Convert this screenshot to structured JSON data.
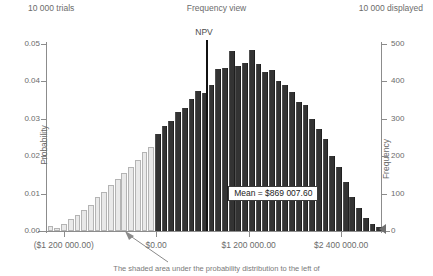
{
  "header": {
    "trials": "10 000 trials",
    "title": "Frequency view",
    "displayed": "10 000 displayed"
  },
  "annotations": {
    "npv_label": "NPV",
    "mean_label": "Mean = $869 007.60",
    "caption": "The shaded area under the probability distribution to the left of"
  },
  "colors": {
    "bar_dark": "#333333",
    "bar_light": "#e9e9e9",
    "bar_light_border": "#b4b4b4",
    "axis": "#8c8c8c",
    "text": "#6b6b6b",
    "npv_line": "#111111"
  },
  "chart_data": {
    "type": "bar",
    "title": "Frequency view",
    "xlabel": "",
    "ylabel": "Probability",
    "y2label": "Frequency",
    "ylim": [
      0,
      0.05
    ],
    "y2lim": [
      0,
      500
    ],
    "yticks": [
      "0.00",
      "0.01",
      "0.02",
      "0.03",
      "0.04",
      "0.05"
    ],
    "ytick_values": [
      0.0,
      0.01,
      0.02,
      0.03,
      0.04,
      0.05
    ],
    "y2ticks": [
      "0",
      "100",
      "200",
      "300",
      "400",
      "500"
    ],
    "y2tick_values": [
      0,
      100,
      200,
      300,
      400,
      500
    ],
    "xticks": [
      "($1 200 000.00)",
      "$0.00",
      "$1 200 000.00",
      "$2 400 000.00"
    ],
    "xtick_values": [
      -1200000,
      0,
      1200000,
      2400000
    ],
    "xlim": [
      -1430000,
      2930000
    ],
    "grid": false,
    "legend": null,
    "bar_count": 50,
    "shade_split_value": 0,
    "mean_value": 869007.6,
    "npv_marker_value": 650000,
    "n_trials": 10000,
    "n_displayed": 10000,
    "bin_centers": [
      -1370000,
      -1283000,
      -1196000,
      -1109000,
      -1022000,
      -935000,
      -848000,
      -761000,
      -674000,
      -587000,
      -500000,
      -413000,
      -326000,
      -239000,
      -152000,
      -65000,
      22000,
      109000,
      196000,
      283000,
      370000,
      457000,
      544000,
      631000,
      718000,
      805000,
      892000,
      979000,
      1066000,
      1153000,
      1240000,
      1327000,
      1414000,
      1501000,
      1588000,
      1675000,
      1762000,
      1849000,
      1936000,
      2023000,
      2110000,
      2197000,
      2284000,
      2371000,
      2458000,
      2545000,
      2632000,
      2719000,
      2806000,
      2893000
    ],
    "values": [
      0.0014,
      0.0007,
      0.002,
      0.0033,
      0.0042,
      0.0055,
      0.007,
      0.0092,
      0.0105,
      0.0122,
      0.014,
      0.0155,
      0.0172,
      0.019,
      0.021,
      0.0225,
      0.026,
      0.028,
      0.0295,
      0.0318,
      0.033,
      0.0352,
      0.0375,
      0.0368,
      0.039,
      0.0432,
      0.0436,
      0.0482,
      0.0442,
      0.045,
      0.0485,
      0.0447,
      0.0425,
      0.043,
      0.04,
      0.039,
      0.0372,
      0.0345,
      0.0338,
      0.03,
      0.0272,
      0.0245,
      0.02,
      0.0172,
      0.013,
      0.009,
      0.0062,
      0.0035,
      0.002,
      0.001
    ],
    "frequencies": [
      14,
      7,
      20,
      33,
      42,
      55,
      70,
      92,
      105,
      122,
      140,
      155,
      172,
      190,
      210,
      225,
      260,
      280,
      295,
      318,
      330,
      352,
      375,
      368,
      390,
      432,
      436,
      482,
      442,
      450,
      485,
      447,
      425,
      430,
      400,
      390,
      372,
      345,
      338,
      300,
      272,
      245,
      200,
      172,
      130,
      90,
      62,
      35,
      20,
      10
    ]
  }
}
